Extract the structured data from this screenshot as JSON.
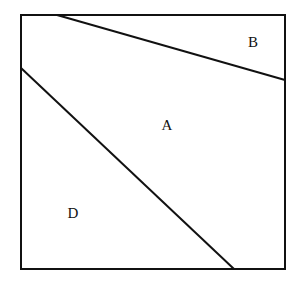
{
  "diagram": {
    "type": "partitioned-square",
    "square": {
      "x1": 21,
      "y1": 15,
      "x2": 285,
      "y2": 269
    },
    "lines": [
      {
        "name": "upper-line",
        "x1": 57,
        "y1": 15,
        "x2": 285,
        "y2": 80
      },
      {
        "name": "diagonal-line",
        "x1": 21,
        "y1": 68,
        "x2": 234,
        "y2": 269
      }
    ],
    "regions": [
      {
        "label": "B",
        "x": 253,
        "y": 47
      },
      {
        "label": "A",
        "x": 167,
        "y": 130
      },
      {
        "label": "D",
        "x": 73,
        "y": 218
      }
    ],
    "stroke_color": "#111111"
  }
}
